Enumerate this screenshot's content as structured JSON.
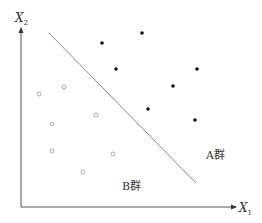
{
  "diagram": {
    "axes": {
      "x_label": "X",
      "x_sub": "1",
      "y_label": "X",
      "y_sub": "2"
    },
    "groups": {
      "a_label": "A群",
      "b_label": "B群"
    },
    "group_a_points": [
      [
        102,
        43
      ],
      [
        142,
        33
      ],
      [
        116,
        69
      ],
      [
        197,
        69
      ],
      [
        173,
        86
      ],
      [
        148,
        109
      ],
      [
        195,
        120
      ]
    ],
    "group_b_points": [
      [
        39,
        94
      ],
      [
        64,
        87
      ],
      [
        52,
        124
      ],
      [
        96,
        115
      ],
      [
        52,
        151
      ],
      [
        113,
        154
      ],
      [
        83,
        172
      ]
    ],
    "separator_line": {
      "x1": 49,
      "y1": 33,
      "x2": 196,
      "y2": 183
    },
    "colors": {
      "axis": "#555555",
      "line": "#888888",
      "filled": "#111111",
      "hollow": "#999999"
    }
  }
}
